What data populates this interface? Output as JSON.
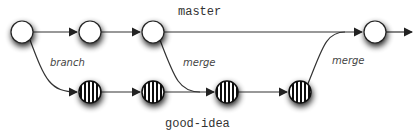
{
  "diagram": {
    "type": "git-branch-merge",
    "branches": [
      {
        "name": "master",
        "label": "master"
      },
      {
        "name": "good-idea",
        "label": "good-idea"
      }
    ],
    "edge_labels": {
      "branch": "branch",
      "merge_to_idea": "merge",
      "merge_to_master": "merge"
    },
    "master_commits": [
      {
        "id": "m1",
        "x": 22,
        "y": 32
      },
      {
        "id": "m2",
        "x": 90,
        "y": 32
      },
      {
        "id": "m3",
        "x": 153,
        "y": 32
      },
      {
        "id": "m4",
        "x": 375,
        "y": 32
      }
    ],
    "idea_commits": [
      {
        "id": "g1",
        "x": 90,
        "y": 92
      },
      {
        "id": "g2",
        "x": 153,
        "y": 92
      },
      {
        "id": "g3",
        "x": 227,
        "y": 92
      },
      {
        "id": "g4",
        "x": 300,
        "y": 92
      }
    ],
    "colors": {
      "line": "#333333",
      "node_fill": "#ffffff",
      "stripe": "#111111",
      "shadow": "#000000"
    }
  }
}
